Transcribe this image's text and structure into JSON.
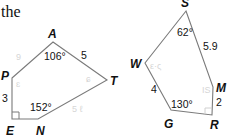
{
  "text_fragment": "the",
  "colors": {
    "stroke": "#7a7a7a",
    "text": "#111111",
    "faint_marks": "#d6d6d6"
  },
  "figure_left": {
    "vertices": {
      "A": "A",
      "T": "T",
      "N": "N",
      "E": "E",
      "P": "P"
    },
    "measures": {
      "angle_A": "106°",
      "side_AT": "5",
      "side_PE": "3",
      "angle_N": "152°"
    },
    "right_angle_at": "E",
    "faint_marks": [
      "9",
      "ɛ",
      "ɕ",
      "5 ℓ"
    ]
  },
  "figure_right": {
    "vertices": {
      "S": "S",
      "W": "W",
      "M": "M",
      "R": "R",
      "G": "G"
    },
    "measures": {
      "angle_S": "62°",
      "side_SM": "5.9",
      "side_WG": "4",
      "angle_G": "130°",
      "side_MR": "2"
    },
    "right_angle_at": "R",
    "faint_marks": [
      "ε·ς",
      "IS"
    ]
  }
}
